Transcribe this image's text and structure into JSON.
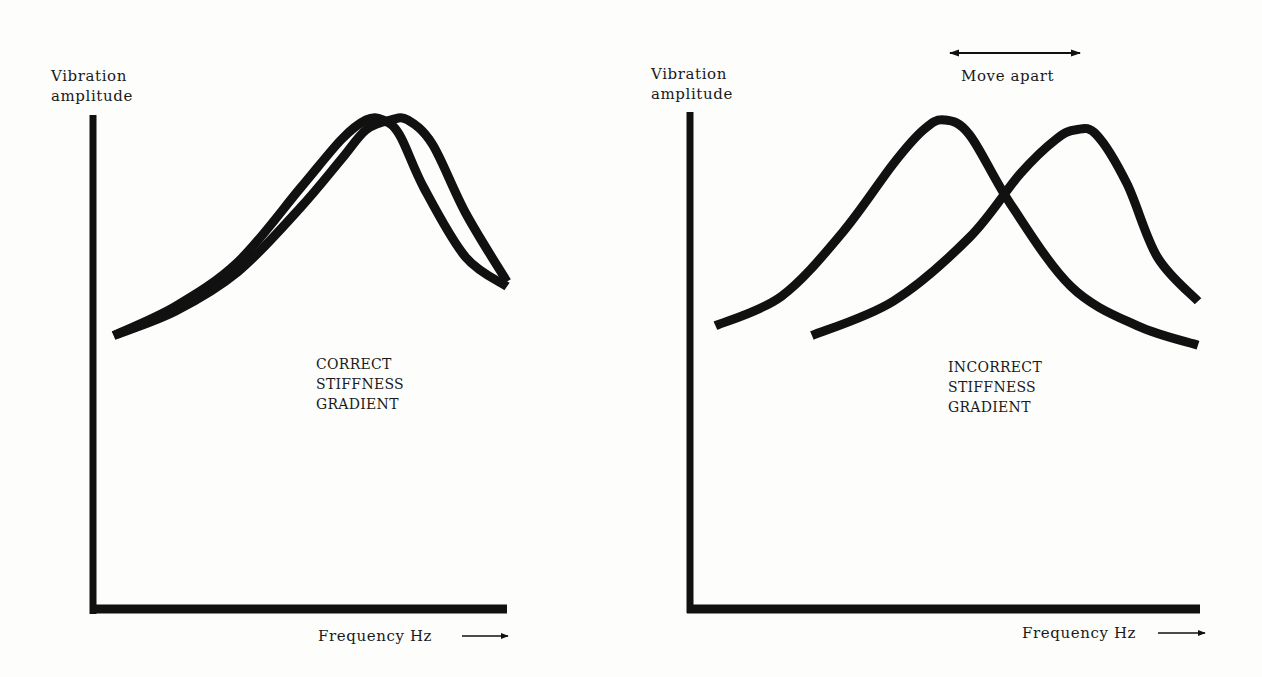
{
  "figure": {
    "panels": [
      {
        "id": "left",
        "y_label_lines": [
          "Vibration",
          "amplitude"
        ],
        "x_label": "Frequency Hz",
        "caption_lines": [
          "CORRECT",
          "STIFFNESS",
          "GRADIENT"
        ]
      },
      {
        "id": "right",
        "y_label_lines": [
          "Vibration",
          "amplitude"
        ],
        "x_label": "Frequency Hz",
        "caption_lines": [
          "INCORRECT",
          "STIFFNESS",
          "GRADIENT"
        ],
        "annotation": "Move apart"
      }
    ],
    "ink_color": "#111111",
    "paper_color": "#fdfdfc"
  },
  "chart_data": [
    {
      "type": "line",
      "title": "CORRECT STIFFNESS GRADIENT",
      "xlabel": "Frequency Hz",
      "ylabel": "Vibration amplitude",
      "xlim": [
        0,
        1
      ],
      "ylim": [
        0,
        1
      ],
      "grid": false,
      "series": [
        {
          "name": "resonance-curve-a",
          "x": [
            0.05,
            0.2,
            0.35,
            0.5,
            0.6,
            0.66,
            0.7,
            0.74,
            0.8,
            0.9,
            1.0
          ],
          "y": [
            0.55,
            0.61,
            0.7,
            0.85,
            0.95,
            0.99,
            0.99,
            0.96,
            0.85,
            0.71,
            0.65
          ]
        },
        {
          "name": "resonance-curve-b",
          "x": [
            0.05,
            0.2,
            0.35,
            0.5,
            0.6,
            0.66,
            0.72,
            0.76,
            0.82,
            0.9,
            1.0
          ],
          "y": [
            0.55,
            0.6,
            0.68,
            0.81,
            0.91,
            0.97,
            0.99,
            0.99,
            0.94,
            0.8,
            0.66
          ]
        }
      ]
    },
    {
      "type": "line",
      "title": "INCORRECT STIFFNESS GRADIENT",
      "xlabel": "Frequency Hz",
      "ylabel": "Vibration amplitude",
      "xlim": [
        0,
        1
      ],
      "ylim": [
        0,
        1
      ],
      "grid": false,
      "annotation": "Move apart",
      "series": [
        {
          "name": "resonance-curve-low",
          "x": [
            0.05,
            0.18,
            0.3,
            0.4,
            0.46,
            0.5,
            0.55,
            0.63,
            0.75,
            0.88,
            1.0
          ],
          "y": [
            0.57,
            0.63,
            0.76,
            0.9,
            0.97,
            0.99,
            0.96,
            0.82,
            0.65,
            0.57,
            0.53
          ]
        },
        {
          "name": "resonance-curve-high",
          "x": [
            0.24,
            0.4,
            0.55,
            0.65,
            0.72,
            0.76,
            0.8,
            0.86,
            0.92,
            1.0
          ],
          "y": [
            0.55,
            0.62,
            0.75,
            0.88,
            0.95,
            0.97,
            0.96,
            0.86,
            0.71,
            0.62
          ]
        }
      ]
    }
  ]
}
